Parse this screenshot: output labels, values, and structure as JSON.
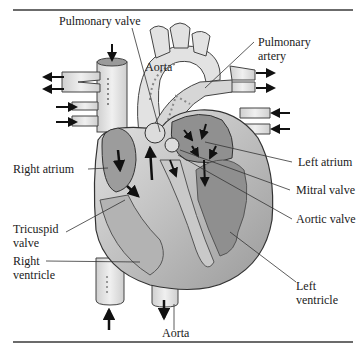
{
  "figure": {
    "labels": {
      "pulmonary_valve": "Pulmonary valve",
      "aorta_top": "Aorta",
      "pulmonary_artery_line1": "Pulmonary",
      "pulmonary_artery_line2": "artery",
      "right_atrium": "Right atrium",
      "left_atrium": "Left atrium",
      "mitral_valve": "Mitral valve",
      "aortic_valve": "Aortic valve",
      "tricuspid_valve_line1": "Tricuspid",
      "tricuspid_valve_line2": "valve",
      "right_ventricle_line1": "Right",
      "right_ventricle_line2": "ventricle",
      "left_ventricle_line1": "Left",
      "left_ventricle_line2": "ventricle",
      "aorta_bottom": "Aorta"
    },
    "colors": {
      "outline": "#3a3a3a",
      "heart_light": "#d9d9d9",
      "heart_mid": "#a8a8a8",
      "heart_dark": "#8a8a8a",
      "vessel": "#e6e6e6",
      "rule": "#6b6b6b"
    }
  }
}
